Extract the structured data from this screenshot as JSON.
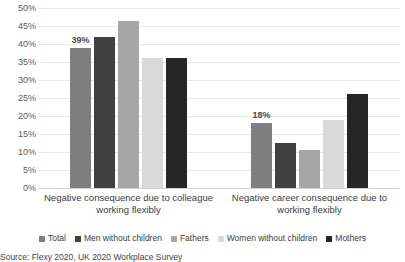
{
  "chart_data": {
    "type": "bar",
    "title": "",
    "subtitle": "",
    "xlabel": "",
    "ylabel": "",
    "ylim": [
      0,
      50
    ],
    "ytick_step": 5,
    "grid": true,
    "grid_axis": "y",
    "legend_position": "bottom",
    "value_suffix": "%",
    "categories": [
      "Negative consequence due to colleague working flexibly",
      "Negative career consequence due to working flexibly"
    ],
    "yticks": [
      "50%",
      "45%",
      "40%",
      "35%",
      "30%",
      "25%",
      "20%",
      "15%",
      "10%",
      "5%",
      "0%"
    ],
    "series": [
      {
        "name": "Total",
        "color": "#7f7f7f",
        "values": [
          39,
          18
        ]
      },
      {
        "name": "Men without children",
        "color": "#404040",
        "values": [
          42,
          12.5
        ]
      },
      {
        "name": "Fathers",
        "color": "#a6a6a6",
        "values": [
          46.5,
          10.5
        ]
      },
      {
        "name": "Women without children",
        "color": "#d9d9d9",
        "values": [
          36,
          19
        ]
      },
      {
        "name": "Mothers",
        "color": "#262626",
        "values": [
          36,
          26
        ]
      }
    ],
    "data_labels": [
      {
        "category_index": 0,
        "series_index": 0,
        "text": "39%"
      },
      {
        "category_index": 1,
        "series_index": 0,
        "text": "18%"
      }
    ]
  },
  "footnote": {
    "text": "Source: Flexy 2020, UK 2020 Workplace Survey"
  }
}
